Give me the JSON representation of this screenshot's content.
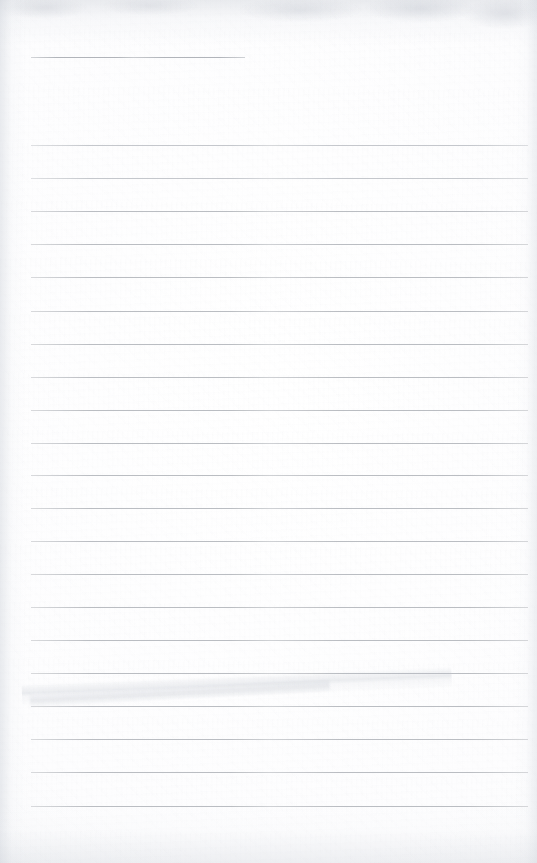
{
  "document": {
    "kind": "scanned-lined-paper",
    "title": "",
    "page_width": 537,
    "page_height": 863,
    "orientation": "portrait",
    "content_text": "",
    "is_blank": true
  },
  "paper": {
    "background_color": "#fdfdfd",
    "highlight_color": "#ffffff",
    "vignette_color": "#f4f5f7",
    "texture": "scan-grain"
  },
  "rules": {
    "line_color": "#b7babf",
    "soft_line_color": "#c2c5ca",
    "faint_line_color": "#ccced3",
    "line_thickness_px": 1,
    "left_margin_px": 31,
    "right_edge_px": 528,
    "line_spacing_px": 32.7,
    "count": 22,
    "items": [
      {
        "name": "header-rule",
        "y": 57,
        "x": 31,
        "width": 214,
        "tone": "header-rule"
      },
      {
        "name": "rule-01",
        "y": 145,
        "x": 31,
        "width": 497,
        "tone": "soft"
      },
      {
        "name": "rule-02",
        "y": 178,
        "x": 31,
        "width": 497,
        "tone": "soft"
      },
      {
        "name": "rule-03",
        "y": 211,
        "x": 31,
        "width": 497,
        "tone": ""
      },
      {
        "name": "rule-04",
        "y": 244,
        "x": 31,
        "width": 497,
        "tone": ""
      },
      {
        "name": "rule-05",
        "y": 277,
        "x": 31,
        "width": 497,
        "tone": ""
      },
      {
        "name": "rule-06",
        "y": 311,
        "x": 31,
        "width": 497,
        "tone": ""
      },
      {
        "name": "rule-07",
        "y": 344,
        "x": 31,
        "width": 497,
        "tone": ""
      },
      {
        "name": "rule-08",
        "y": 377,
        "x": 31,
        "width": 497,
        "tone": ""
      },
      {
        "name": "rule-09",
        "y": 410,
        "x": 31,
        "width": 497,
        "tone": ""
      },
      {
        "name": "rule-10",
        "y": 443,
        "x": 31,
        "width": 497,
        "tone": ""
      },
      {
        "name": "rule-11",
        "y": 475,
        "x": 31,
        "width": 497,
        "tone": ""
      },
      {
        "name": "rule-12",
        "y": 508,
        "x": 31,
        "width": 497,
        "tone": ""
      },
      {
        "name": "rule-13",
        "y": 541,
        "x": 31,
        "width": 497,
        "tone": ""
      },
      {
        "name": "rule-14",
        "y": 574,
        "x": 31,
        "width": 497,
        "tone": ""
      },
      {
        "name": "rule-15",
        "y": 607,
        "x": 31,
        "width": 497,
        "tone": ""
      },
      {
        "name": "rule-16",
        "y": 640,
        "x": 31,
        "width": 497,
        "tone": ""
      },
      {
        "name": "rule-17",
        "y": 673,
        "x": 31,
        "width": 497,
        "tone": ""
      },
      {
        "name": "rule-18",
        "y": 706,
        "x": 31,
        "width": 497,
        "tone": ""
      },
      {
        "name": "rule-19",
        "y": 739,
        "x": 31,
        "width": 497,
        "tone": ""
      },
      {
        "name": "rule-20",
        "y": 772,
        "x": 31,
        "width": 497,
        "tone": ""
      },
      {
        "name": "rule-21",
        "y": 806,
        "x": 31,
        "width": 497,
        "tone": ""
      }
    ]
  },
  "artifacts": {
    "crease_label": "diagonal fold crease",
    "top_shadow_label": "scan edge shadow",
    "grain_label": "paper grain"
  }
}
